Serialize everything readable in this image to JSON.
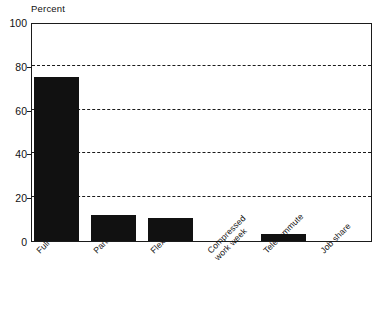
{
  "chart_data": {
    "type": "bar",
    "title": "",
    "subtitle": "",
    "xlabel": "",
    "ylabel": "Percent",
    "ylim": [
      0,
      100
    ],
    "yticks": [
      0,
      20,
      40,
      60,
      80,
      100
    ],
    "ytick_labels": [
      "0",
      "20",
      "40",
      "60",
      "80",
      "100"
    ],
    "grid": "horizontal-dashed",
    "gridline_values": [
      20,
      40,
      60,
      80
    ],
    "legend": "none",
    "bar_color": "#111111",
    "frame_color": "#1b1b1b",
    "categories": [
      "Full-time",
      "Part-time",
      "Flexitime",
      "Compressed work week",
      "Telecommute",
      "Job share"
    ],
    "category_lines": [
      [
        "Full-time"
      ],
      [
        "Part-time"
      ],
      [
        "Flexitime"
      ],
      [
        "Compressed",
        "work week"
      ],
      [
        "Telecommute"
      ],
      [
        "Job share"
      ]
    ],
    "values": [
      75,
      12,
      10.5,
      0,
      3,
      0
    ],
    "value_labels": [
      "75",
      "12",
      "10.5",
      "0",
      "3",
      "0"
    ]
  },
  "axis": {
    "y_title": "Percent"
  }
}
